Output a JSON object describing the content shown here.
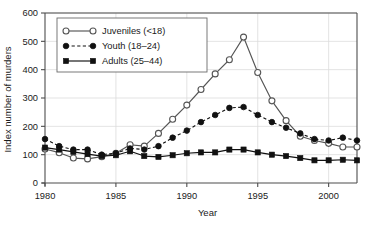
{
  "chart_data": {
    "type": "line",
    "title": "",
    "xlabel": "Year",
    "ylabel": "Index number of murders",
    "xlim": [
      1980,
      2002
    ],
    "ylim": [
      0,
      600
    ],
    "xticks": [
      1980,
      1985,
      1990,
      1995,
      2000
    ],
    "yticks": [
      0,
      100,
      200,
      300,
      400,
      500,
      600
    ],
    "grid": true,
    "grid_axis": "y",
    "legend_position": "upper-left",
    "x": [
      1980,
      1981,
      1982,
      1983,
      1984,
      1985,
      1986,
      1987,
      1988,
      1989,
      1990,
      1991,
      1992,
      1993,
      1994,
      1995,
      1996,
      1997,
      1998,
      1999,
      2000,
      2001,
      2002
    ],
    "series": [
      {
        "name": "Juveniles (<18)",
        "marker": "open-circle",
        "line": "solid",
        "color": "#555555",
        "values": [
          120,
          107,
          88,
          85,
          93,
          105,
          135,
          130,
          175,
          225,
          275,
          330,
          385,
          435,
          515,
          390,
          290,
          220,
          165,
          150,
          140,
          127,
          127
        ]
      },
      {
        "name": "Youth (18–24)",
        "marker": "filled-circle",
        "line": "dashed",
        "color": "#111111",
        "values": [
          155,
          130,
          118,
          118,
          100,
          105,
          122,
          118,
          130,
          160,
          185,
          215,
          240,
          265,
          268,
          240,
          215,
          195,
          175,
          155,
          150,
          160,
          150
        ]
      },
      {
        "name": "Adults (25–44)",
        "marker": "filled-square",
        "line": "solid",
        "color": "#111111",
        "values": [
          125,
          118,
          110,
          102,
          95,
          98,
          112,
          95,
          92,
          98,
          105,
          108,
          108,
          118,
          118,
          108,
          100,
          95,
          88,
          80,
          80,
          82,
          80
        ]
      }
    ]
  },
  "legend": {
    "items": [
      {
        "label": "Juveniles (<18)"
      },
      {
        "label": "Youth (18–24)"
      },
      {
        "label": "Adults (25–44)"
      }
    ]
  },
  "axes": {
    "x_tick_labels": [
      "1980",
      "1985",
      "1990",
      "1995",
      "2000"
    ],
    "y_tick_labels": [
      "0",
      "100",
      "200",
      "300",
      "400",
      "500",
      "600"
    ],
    "xlabel": "Year",
    "ylabel": "Index number of murders"
  },
  "colors": {
    "axis": "#4d4d4d",
    "grid": "#dcdcdc",
    "juveniles": "#555555",
    "youth": "#111111",
    "adults": "#111111",
    "text": "#1a1a1a"
  }
}
